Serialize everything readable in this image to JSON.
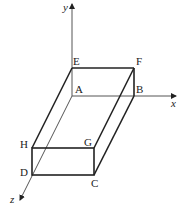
{
  "diagram": {
    "type": "3d-box-coordinate",
    "axes": {
      "x": "x",
      "y": "y",
      "z": "z"
    },
    "vertices": {
      "A": "A",
      "B": "B",
      "C": "C",
      "D": "D",
      "E": "E",
      "F": "F",
      "G": "G",
      "H": "H"
    },
    "colors": {
      "line": "#222222",
      "axis": "#555555"
    }
  }
}
